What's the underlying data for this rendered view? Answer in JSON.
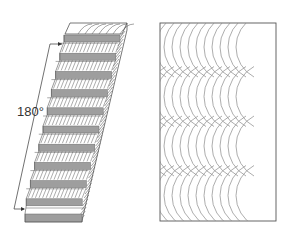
{
  "figure": {
    "left": {
      "name": "laminated-beam-twisted",
      "angle_label": "180°",
      "lamella_count": 10,
      "colors": {
        "lamella_fill": "#9e9e9e",
        "lamella_stroke": "#6a6a6a",
        "grain_stroke": "#666666",
        "outline": "#555555"
      }
    },
    "right": {
      "name": "grain-pattern-panel",
      "arc_rows": 4,
      "colors": {
        "arc_stroke": "#8a8a8a",
        "outline": "#555555"
      }
    }
  }
}
